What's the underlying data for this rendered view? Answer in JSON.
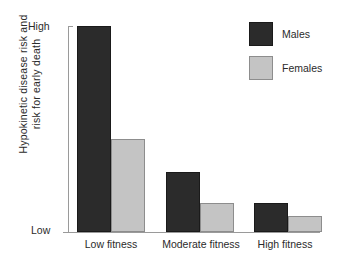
{
  "chart_data": {
    "type": "bar",
    "title": "",
    "xlabel": "",
    "ylabel_lines": [
      "Hypokinetic disease risk and",
      "risk for early death"
    ],
    "ylabel": "Hypokinetic disease risk and risk for early death",
    "categories": [
      "Low fitness",
      "Moderate fitness",
      "High fitness"
    ],
    "series": [
      {
        "name": "Males",
        "color": "#2b2b2b",
        "values": [
          100,
          29,
          14
        ]
      },
      {
        "name": "Females",
        "color": "#c4c4c4",
        "values": [
          45,
          14,
          8
        ]
      }
    ],
    "y_tick_labels": [
      "Low",
      "High"
    ],
    "ylim": [
      0,
      100
    ],
    "y_axis_scale": "qualitative",
    "grid": false,
    "legend_position": "top-right"
  },
  "axis": {
    "high_label": "High",
    "low_label": "Low"
  },
  "legend": {
    "entries": [
      {
        "label": "Males",
        "swatch": "males-swatch"
      },
      {
        "label": "Females",
        "swatch": "females-swatch"
      }
    ]
  },
  "colors": {
    "males": "#2b2b2b",
    "females": "#c4c4c4",
    "axis": "#9a9a9a",
    "text": "#2b2b2b",
    "background": "#ffffff"
  }
}
